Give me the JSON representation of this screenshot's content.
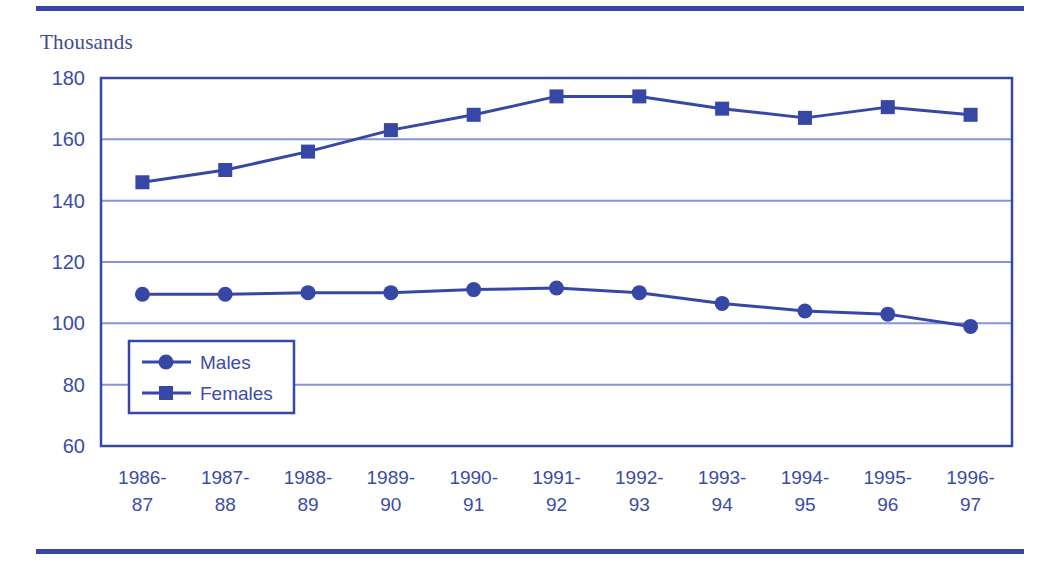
{
  "figure": {
    "unit_label": "Thousands",
    "top_rule_color": "#3647a5",
    "bottom_rule_color": "#3647a5",
    "background": "#ffffff"
  },
  "chart_data": {
    "type": "line",
    "title": "",
    "subtitle": "",
    "xlabel": "",
    "ylabel": "Thousands",
    "categories": [
      "1986-87",
      "1987-88",
      "1988-89",
      "1989-90",
      "1990-91",
      "1991-92",
      "1992-93",
      "1993-94",
      "1994-95",
      "1995-96",
      "1996-97"
    ],
    "category_lines": [
      [
        "1986-",
        "87"
      ],
      [
        "1987-",
        "88"
      ],
      [
        "1988-",
        "89"
      ],
      [
        "1989-",
        "90"
      ],
      [
        "1990-",
        "91"
      ],
      [
        "1991-",
        "92"
      ],
      [
        "1992-",
        "93"
      ],
      [
        "1993-",
        "94"
      ],
      [
        "1994-",
        "95"
      ],
      [
        "1995-",
        "96"
      ],
      [
        "1996-",
        "97"
      ]
    ],
    "series": [
      {
        "name": "Males",
        "marker": "circle",
        "color": "#3647a5",
        "values": [
          109.5,
          109.5,
          110,
          110,
          111,
          111.5,
          110,
          106.5,
          104,
          103,
          99
        ]
      },
      {
        "name": "Females",
        "marker": "square",
        "color": "#3647a5",
        "values": [
          146,
          150,
          156,
          163,
          168,
          174,
          174,
          170,
          167,
          170.5,
          168
        ]
      }
    ],
    "ylim": [
      60,
      180
    ],
    "yticks": [
      60,
      80,
      100,
      120,
      140,
      160,
      180
    ],
    "ytick_labels": [
      "60",
      "80",
      "100",
      "120",
      "140",
      "160",
      "180"
    ],
    "grid": true,
    "grid_color": "#8794d8",
    "axis_color": "#3647a5",
    "legend_position": "inside-lower-left",
    "legend_entries": [
      "Males",
      "Females"
    ]
  }
}
